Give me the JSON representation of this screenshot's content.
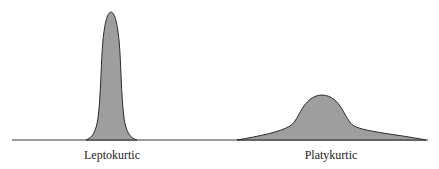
{
  "figure": {
    "fill_color": "#9e9e9e",
    "stroke_color": "#2a2a2a",
    "curves": [
      {
        "name": "leptokurtic",
        "label": "Leptokurtic",
        "shape": "tall narrow peak"
      },
      {
        "name": "platykurtic",
        "label": "Platykurtic",
        "shape": "low broad peak"
      }
    ]
  }
}
